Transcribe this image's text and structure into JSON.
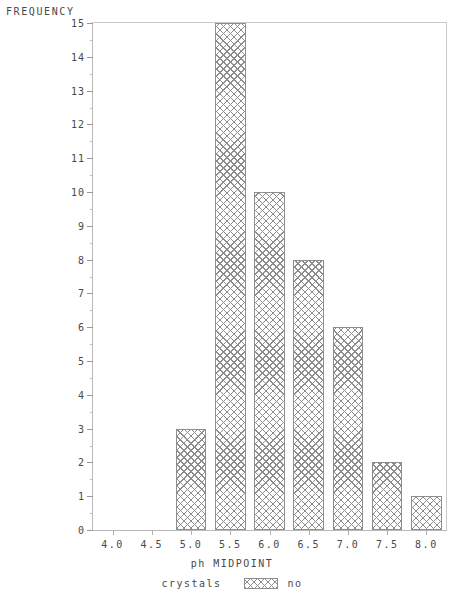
{
  "chart_data": {
    "type": "bar",
    "title": "",
    "xlabel": "ph MIDPOINT",
    "ylabel": "FREQUENCY",
    "categories": [
      "4.0",
      "4.5",
      "5.0",
      "5.5",
      "6.0",
      "6.5",
      "7.0",
      "7.5",
      "8.0"
    ],
    "values": [
      0,
      0,
      3,
      15,
      10,
      8,
      6,
      2,
      1
    ],
    "xlim": [
      3.75,
      8.25
    ],
    "ylim": [
      0,
      15
    ],
    "ytick_step": 1,
    "yticks": [
      0,
      1,
      2,
      3,
      4,
      5,
      6,
      7,
      8,
      9,
      10,
      11,
      12,
      13,
      14,
      15
    ],
    "ytick_labels": [
      "0",
      "1",
      "2",
      "3",
      "4",
      "5",
      "6",
      "7",
      "8",
      "9",
      "10",
      "11",
      "12",
      "13",
      "14",
      "15"
    ],
    "grid": false,
    "legend_position": "bottom",
    "legend": [
      {
        "label": "crystals",
        "type": "text"
      },
      {
        "label": "no",
        "type": "swatch",
        "pattern": "cross-hatch",
        "color": "#8d8d8d"
      }
    ],
    "bar_fill": "cross-hatch",
    "bar_edge_color": "#8e8e8e",
    "background": "#ffffff",
    "axis_color": "#b9b9b9"
  }
}
